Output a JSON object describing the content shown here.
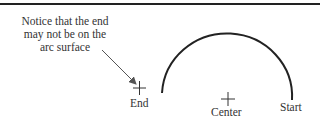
{
  "diagram": {
    "note": {
      "lines": [
        "Notice that the end",
        "may not be on the",
        "arc surface"
      ]
    },
    "labels": {
      "end": "End",
      "center": "Center",
      "start": "Start"
    },
    "colors": {
      "stroke": "#222222",
      "text": "#333333",
      "leader": "#555555"
    }
  }
}
